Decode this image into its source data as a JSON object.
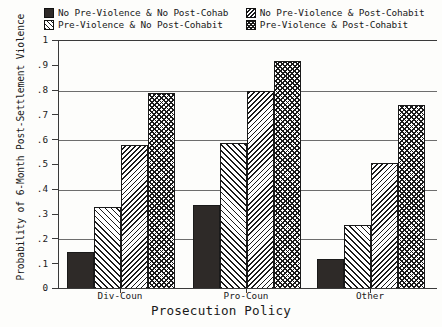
{
  "chart_data": {
    "type": "bar",
    "title": "",
    "xlabel": "Prosecution Policy",
    "ylabel": "Probability of 6-Month Post-Settlement Violence",
    "categories": [
      "Div-Coun",
      "Pro-Coun",
      "Other"
    ],
    "ylim": [
      0,
      1
    ],
    "yticks": [
      "0",
      ".1",
      ".2",
      ".3",
      ".4",
      ".5",
      ".6",
      ".7",
      ".8",
      ".9",
      "1"
    ],
    "ytick_values": [
      0,
      0.1,
      0.2,
      0.3,
      0.4,
      0.5,
      0.6,
      0.7,
      0.8,
      0.9,
      1
    ],
    "gridlines": [
      0.2,
      0.4,
      0.6,
      0.8,
      1.0
    ],
    "grid": true,
    "legend_position": "top",
    "series": [
      {
        "name": "No Pre-Violence & No Post-Cohab",
        "pattern": "solid",
        "values": [
          0.15,
          0.34,
          0.12
        ]
      },
      {
        "name": "Pre-Violence & No Post-Cohabit",
        "pattern": "diagonal-hatch",
        "values": [
          0.33,
          0.59,
          0.26
        ]
      },
      {
        "name": "No Pre-Violence & Post-Cohabit",
        "pattern": "dense-diagonal-hatch",
        "values": [
          0.58,
          0.8,
          0.51
        ]
      },
      {
        "name": "Pre-Violence & Post-Cohabit",
        "pattern": "cross-hatch",
        "values": [
          0.79,
          0.92,
          0.74
        ]
      }
    ]
  },
  "legend": {
    "entries": [
      {
        "label": "No Pre-Violence & No Post-Cohab",
        "swatch": "solid-swatch"
      },
      {
        "label": "No Pre-Violence & Post-Cohabit",
        "swatch": "dense-hatch-swatch"
      },
      {
        "label": "Pre-Violence & No Post-Cohabit",
        "swatch": "hatch-swatch"
      },
      {
        "label": "Pre-Violence & Post-Cohabit",
        "swatch": "cross-hatch-swatch"
      }
    ]
  },
  "colors": {
    "background": "#fdfdfb",
    "axis": "#3a3a3a",
    "grid": "#6d6d6d",
    "ink": "#1a1a1a",
    "solid_fill": "#2e2a28"
  }
}
